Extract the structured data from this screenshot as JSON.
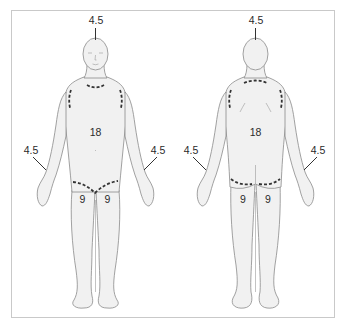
{
  "figures": {
    "anterior": {
      "name": "Front view",
      "regions": {
        "head": "4.5",
        "trunk": "18",
        "left_arm": "4.5",
        "right_arm": "4.5",
        "left_leg": "9",
        "right_leg": "9"
      }
    },
    "posterior": {
      "name": "Back view",
      "regions": {
        "head": "4.5",
        "trunk": "18",
        "left_arm": "4.5",
        "right_arm": "4.5",
        "left_leg": "9",
        "right_leg": "9"
      }
    }
  },
  "colors": {
    "body_fill": "#f1f1f1",
    "outline": "#8a8a8a",
    "dashed_boundary": "#333333",
    "frame": "#c9c9c9"
  }
}
